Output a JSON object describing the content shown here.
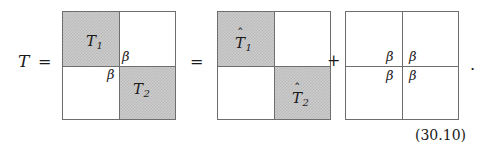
{
  "equation": {
    "lead_symbol": "T",
    "lead_equals": "=",
    "equals_2": "=",
    "plus": "+",
    "trailing_period": ".",
    "number": "(30.10)"
  },
  "matrices": [
    {
      "name": "block-matrix-T",
      "quadrants": [
        {
          "position": "top-left",
          "shaded": true,
          "label": "T",
          "subscript": "1",
          "hat": false
        },
        {
          "position": "top-right",
          "shaded": false,
          "label": "",
          "subscript": "",
          "hat": false
        },
        {
          "position": "bottom-left",
          "shaded": false,
          "label": "",
          "subscript": "",
          "hat": false
        },
        {
          "position": "bottom-right",
          "shaded": true,
          "label": "T",
          "subscript": "2",
          "hat": false
        }
      ],
      "beta_labels": [
        {
          "name": "beta-top-right",
          "text": "β"
        },
        {
          "name": "beta-bottom-left",
          "text": "β"
        }
      ]
    },
    {
      "name": "block-matrix-T-hat",
      "quadrants": [
        {
          "position": "top-left",
          "shaded": true,
          "label": "T",
          "subscript": "1",
          "hat": true
        },
        {
          "position": "top-right",
          "shaded": false,
          "label": "",
          "subscript": "",
          "hat": false
        },
        {
          "position": "bottom-left",
          "shaded": false,
          "label": "",
          "subscript": "",
          "hat": false
        },
        {
          "position": "bottom-right",
          "shaded": true,
          "label": "T",
          "subscript": "2",
          "hat": true
        }
      ],
      "beta_labels": []
    },
    {
      "name": "block-matrix-beta",
      "quadrants": [
        {
          "position": "top-left",
          "shaded": false,
          "label": "",
          "subscript": "",
          "hat": false
        },
        {
          "position": "top-right",
          "shaded": false,
          "label": "",
          "subscript": "",
          "hat": false
        },
        {
          "position": "bottom-left",
          "shaded": false,
          "label": "",
          "subscript": "",
          "hat": false
        },
        {
          "position": "bottom-right",
          "shaded": false,
          "label": "",
          "subscript": "",
          "hat": false
        }
      ],
      "beta_labels": [
        {
          "name": "beta-top-left",
          "text": "β"
        },
        {
          "name": "beta-top-right",
          "text": "β"
        },
        {
          "name": "beta-bottom-left",
          "text": "β"
        },
        {
          "name": "beta-bottom-right",
          "text": "β"
        }
      ]
    }
  ],
  "glyphs": {
    "hat_accent": "ˆ",
    "T": "T",
    "sub1": "1",
    "sub2": "2",
    "beta": "β"
  },
  "colors": {
    "background": "#ffffff",
    "ink": "#1a1a1a",
    "rule": "#6e6e6e",
    "shade_fill": "#cbcbcb",
    "shade_dither": "#b9b9b9"
  }
}
